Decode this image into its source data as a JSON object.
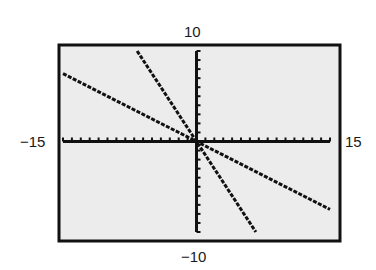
{
  "window": {
    "xmin_label": "−15",
    "xmax_label": "15",
    "ymin_label": "−10",
    "ymax_label": "10"
  },
  "colors": {
    "screen_bg": "#ececec",
    "ink": "#111111",
    "frame": "#111111"
  },
  "chart_data": {
    "type": "line",
    "title": "",
    "xlabel": "",
    "ylabel": "",
    "xlim": [
      -15,
      15
    ],
    "ylim": [
      -10,
      10
    ],
    "xscale": 1,
    "yscale": 1,
    "grid": false,
    "legend": null,
    "tick_labels": {
      "x": [
        "-15",
        "15"
      ],
      "y": [
        "-10",
        "10"
      ]
    },
    "series": [
      {
        "name": "shallow line",
        "equation": "y = -0.5x",
        "slope": -0.5,
        "intercept": 0,
        "x": [
          -15,
          15
        ],
        "y": [
          7.5,
          -7.5
        ]
      },
      {
        "name": "steep line",
        "equation": "y = -1.5x",
        "slope": -1.5,
        "intercept": 0,
        "x": [
          -6.67,
          6.67
        ],
        "y": [
          10,
          -10
        ]
      }
    ]
  }
}
